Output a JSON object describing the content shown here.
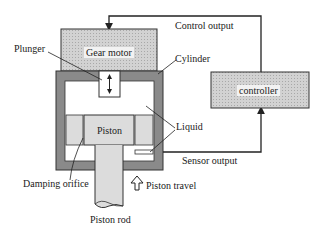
{
  "diagram": {
    "components": {
      "gear_motor": "Gear motor",
      "controller": "controller",
      "piston": "Piston"
    },
    "labels": {
      "plunger": "Plunger",
      "cylinder": "Cylinder",
      "liquid": "Liquid",
      "damping_orifice": "Damping orifice",
      "piston_rod": "Piston rod",
      "piston_travel": "Piston travel",
      "control_output": "Control output",
      "sensor_output": "Sensor output"
    },
    "colors": {
      "stroke": "#222222",
      "cylinder_wall": "#8a8a8a",
      "motor_fill": "#c8c8c8",
      "controller_fill": "#c8c8c8",
      "piston_fill": "#dcdcdc",
      "liquid_fill": "#ffffff"
    }
  }
}
